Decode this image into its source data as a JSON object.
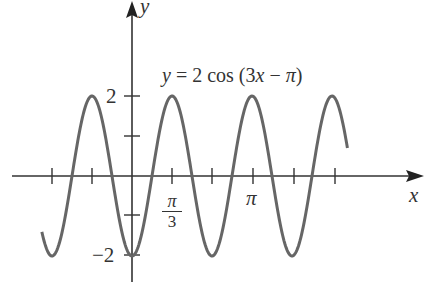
{
  "chart_data": {
    "type": "line",
    "title": "y = 2 cos (3x − π)",
    "equation": "y = 2 cos (3x − π)",
    "xlabel": "x",
    "ylabel": "y",
    "x_tick_labels": [
      {
        "value": 1.0472,
        "label": "π/3"
      },
      {
        "value": 3.1416,
        "label": "π"
      }
    ],
    "y_tick_labels": [
      {
        "value": 2,
        "label": "2"
      },
      {
        "value": -2,
        "label": "−2"
      }
    ],
    "x_ticks": [
      -2.0944,
      -1.0472,
      0,
      1.0472,
      2.0944,
      3.1416,
      4.1888,
      5.236
    ],
    "y_ticks": [
      -2,
      -1,
      1,
      2
    ],
    "xlim": [
      -2.4,
      5.5
    ],
    "ylim": [
      -2,
      2
    ],
    "amplitude": 2,
    "period": "2π/3",
    "phase_shift": "π/3",
    "series": [
      {
        "name": "y = 2 cos (3x − π)",
        "x_range": [
          -2.36,
          5.64
        ],
        "color": "#666666"
      }
    ],
    "grid": false,
    "legend": "none"
  },
  "labels": {
    "y_axis": "y",
    "x_axis": "x",
    "y_two": "2",
    "y_neg_two": "−2",
    "pi_over_three_num": "π",
    "pi_over_three_den": "3",
    "pi": "π",
    "equation": "y = 2 cos (3x − π)"
  }
}
